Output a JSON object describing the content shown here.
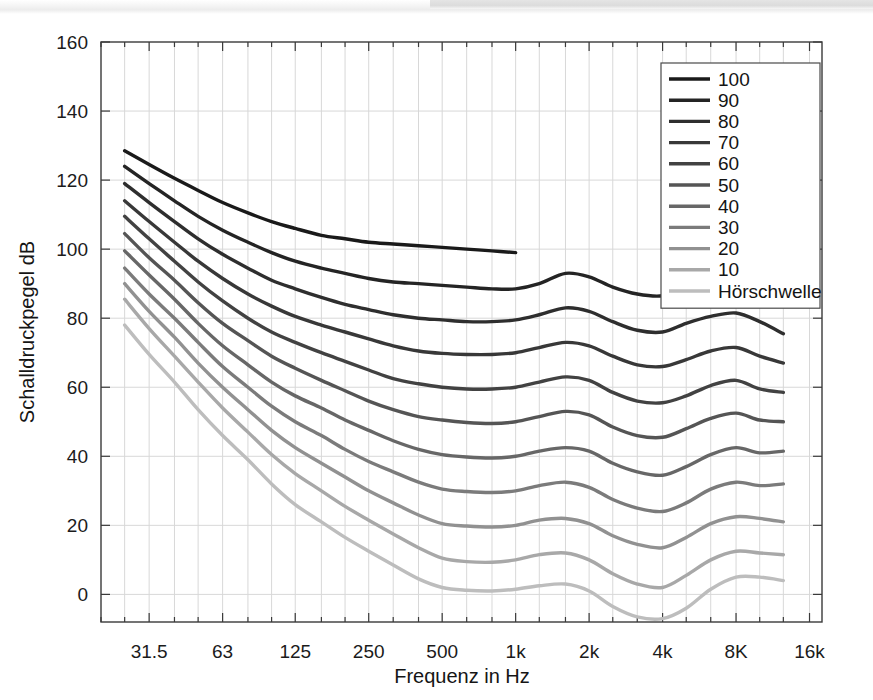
{
  "chart_data": {
    "type": "line",
    "title": "",
    "xlabel": "Frequenz in Hz",
    "ylabel": "Schalldruckpegel dB",
    "xscale": "log",
    "xlim": [
      20,
      18000
    ],
    "ylim": [
      -8,
      160
    ],
    "grid": true,
    "legend_position": "top-right",
    "y_ticks": [
      0,
      20,
      40,
      60,
      80,
      100,
      120,
      140,
      160
    ],
    "y_tick_labels": [
      "0",
      "20",
      "40",
      "60",
      "80",
      "100",
      "120",
      "140",
      "160"
    ],
    "x_ticks": [
      31.5,
      63,
      125,
      250,
      500,
      1000,
      2000,
      4000,
      8000,
      16000
    ],
    "x_tick_labels": [
      "31.5",
      "63",
      "125",
      "250",
      "500",
      "1k",
      "2k",
      "4k",
      "8K",
      "16k"
    ],
    "x_minor_ticks": [
      20,
      25,
      40,
      50,
      80,
      100,
      160,
      200,
      315,
      400,
      630,
      800,
      1250,
      1600,
      2500,
      3150,
      5000,
      6300,
      10000,
      12500
    ],
    "x": [
      25,
      31.5,
      40,
      50,
      63,
      80,
      100,
      125,
      160,
      200,
      250,
      315,
      400,
      500,
      630,
      800,
      1000,
      1250,
      1600,
      2000,
      2500,
      3150,
      4000,
      5000,
      6300,
      8000,
      10000,
      12500
    ],
    "series": [
      {
        "name": "100",
        "color": "#1a1a1a",
        "values": [
          128.5,
          124.5,
          120.5,
          117.0,
          113.5,
          110.5,
          108.0,
          106.0,
          104.0,
          103.0,
          102.0,
          101.5,
          101.0,
          100.5,
          100.0,
          99.5,
          99.0,
          null,
          null,
          null,
          null,
          null,
          null,
          null,
          null,
          null,
          null,
          null
        ]
      },
      {
        "name": "90",
        "color": "#242424",
        "values": [
          124.0,
          119.0,
          114.0,
          109.5,
          105.5,
          102.0,
          99.0,
          96.5,
          94.5,
          93.0,
          91.5,
          90.5,
          90.0,
          89.5,
          89.0,
          88.5,
          88.5,
          90.0,
          93.0,
          92.0,
          89.0,
          87.0,
          86.5,
          89.0,
          92.0,
          93.5,
          91.0,
          84.0
        ]
      },
      {
        "name": "80",
        "color": "#2e2e2e",
        "values": [
          119.0,
          113.5,
          108.0,
          103.0,
          98.5,
          94.5,
          91.0,
          88.5,
          86.0,
          84.0,
          82.5,
          81.0,
          80.0,
          79.5,
          79.0,
          79.0,
          79.5,
          81.0,
          83.0,
          82.0,
          79.0,
          76.5,
          76.0,
          78.5,
          80.5,
          81.5,
          79.0,
          75.5
        ]
      },
      {
        "name": "70",
        "color": "#383838",
        "values": [
          114.0,
          108.0,
          102.0,
          96.5,
          91.5,
          87.0,
          83.5,
          80.5,
          78.0,
          76.0,
          74.0,
          72.0,
          70.5,
          69.8,
          69.5,
          69.5,
          70.0,
          71.5,
          73.0,
          72.0,
          69.0,
          66.5,
          66.0,
          68.0,
          70.5,
          71.5,
          69.0,
          67.0
        ]
      },
      {
        "name": "60",
        "color": "#424242",
        "values": [
          109.5,
          103.0,
          96.5,
          90.5,
          85.0,
          80.0,
          76.0,
          73.0,
          70.0,
          67.5,
          65.0,
          62.5,
          61.0,
          60.0,
          59.5,
          59.5,
          60.0,
          61.5,
          63.0,
          62.0,
          58.5,
          56.0,
          55.5,
          57.5,
          60.5,
          62.0,
          59.5,
          58.5
        ]
      },
      {
        "name": "50",
        "color": "#555555",
        "values": [
          104.5,
          97.5,
          91.0,
          84.5,
          78.5,
          73.5,
          69.0,
          65.5,
          62.0,
          59.0,
          56.0,
          53.5,
          51.5,
          50.5,
          49.8,
          49.5,
          50.0,
          51.5,
          53.0,
          52.0,
          48.5,
          46.0,
          45.5,
          48.0,
          51.0,
          52.5,
          50.5,
          50.0
        ]
      },
      {
        "name": "40",
        "color": "#676767",
        "values": [
          99.5,
          92.5,
          85.5,
          78.5,
          72.0,
          66.5,
          61.5,
          57.5,
          54.0,
          50.5,
          47.5,
          44.5,
          42.0,
          40.5,
          39.8,
          39.5,
          40.0,
          41.5,
          42.5,
          41.5,
          38.0,
          35.5,
          34.5,
          37.0,
          40.5,
          42.5,
          41.0,
          41.5
        ]
      },
      {
        "name": "30",
        "color": "#7b7b7b",
        "values": [
          94.5,
          87.0,
          80.0,
          73.0,
          66.0,
          60.0,
          54.5,
          50.0,
          46.0,
          42.0,
          38.5,
          35.5,
          32.5,
          30.5,
          29.8,
          29.5,
          30.0,
          31.5,
          32.5,
          31.0,
          27.5,
          25.0,
          24.0,
          26.5,
          30.5,
          32.5,
          31.5,
          32.0
        ]
      },
      {
        "name": "20",
        "color": "#919191",
        "values": [
          90.0,
          82.0,
          74.5,
          67.0,
          60.0,
          53.5,
          47.5,
          42.5,
          38.0,
          34.0,
          30.0,
          26.5,
          23.0,
          20.5,
          19.8,
          19.5,
          20.0,
          21.5,
          22.0,
          20.5,
          17.0,
          14.5,
          13.5,
          16.5,
          20.5,
          22.5,
          22.0,
          21.0
        ]
      },
      {
        "name": "10",
        "color": "#a8a8a8",
        "values": [
          85.5,
          77.0,
          69.0,
          61.5,
          54.0,
          47.0,
          40.5,
          35.0,
          30.0,
          25.5,
          21.5,
          17.5,
          13.5,
          10.5,
          9.5,
          9.3,
          10.0,
          11.5,
          12.0,
          10.0,
          6.0,
          3.0,
          2.0,
          5.5,
          10.0,
          12.5,
          12.0,
          11.5
        ]
      },
      {
        "name": "Hörschwelle",
        "color": "#bdbdbd",
        "values": [
          78.0,
          69.5,
          61.5,
          53.5,
          46.0,
          39.0,
          32.0,
          26.0,
          21.0,
          16.5,
          12.5,
          8.5,
          4.5,
          2.0,
          1.2,
          1.0,
          1.5,
          2.5,
          3.0,
          1.0,
          -3.5,
          -6.5,
          -7.0,
          -4.0,
          1.5,
          5.0,
          5.0,
          4.0
        ]
      }
    ]
  },
  "legend": {
    "entries": [
      {
        "label": "100",
        "color": "#1a1a1a"
      },
      {
        "label": "90",
        "color": "#242424"
      },
      {
        "label": "80",
        "color": "#2e2e2e"
      },
      {
        "label": "70",
        "color": "#383838"
      },
      {
        "label": "60",
        "color": "#424242"
      },
      {
        "label": "50",
        "color": "#555555"
      },
      {
        "label": "40",
        "color": "#676767"
      },
      {
        "label": "30",
        "color": "#7b7b7b"
      },
      {
        "label": "20",
        "color": "#919191"
      },
      {
        "label": "10",
        "color": "#a8a8a8"
      },
      {
        "label": "Hörschwelle",
        "color": "#bdbdbd"
      }
    ]
  },
  "style": {
    "axis_color": "#3a3a3a",
    "grid_color": "#d8d8d8",
    "background": "#ffffff",
    "text_color": "#151515"
  }
}
